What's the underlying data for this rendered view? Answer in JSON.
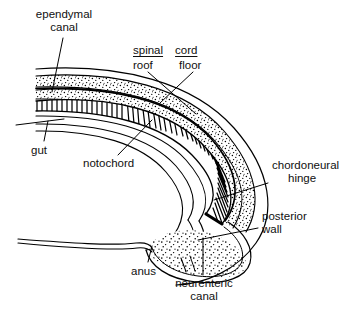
{
  "figure": {
    "type": "line-diagram",
    "background_color": "#ffffff",
    "ink_color": "#000000",
    "labels": {
      "ependymal_canal": {
        "line1": "ependymal",
        "line2": "canal"
      },
      "spinal": "spinal",
      "cord": "cord",
      "roof": "roof",
      "floor": "floor",
      "gut": "gut",
      "notochord": "notochord",
      "chordoneural_hinge": {
        "line1": "chordoneural",
        "line2": "hinge"
      },
      "posterior_wall": {
        "line1": "posterior",
        "line2": "wall"
      },
      "anus": "anus",
      "neurenteric_canal": {
        "line1": "neurenteric",
        "line2": "canal"
      }
    },
    "structures": [
      {
        "name": "ependymal-canal",
        "style": "thin-dark-line",
        "note": "narrow lumen within spinal cord"
      },
      {
        "name": "spinal-cord-roof",
        "style": "stippled-band"
      },
      {
        "name": "spinal-cord-floor",
        "style": "stippled-band"
      },
      {
        "name": "notochord",
        "style": "dense-hatched-band"
      },
      {
        "name": "gut",
        "style": "outline-tube"
      },
      {
        "name": "chordoneural-hinge",
        "style": "inner-pocket"
      },
      {
        "name": "neurenteric-canal",
        "style": "narrow-channel"
      },
      {
        "name": "posterior-wall",
        "style": "stippled-bulb"
      },
      {
        "name": "anus",
        "style": "ventral-opening"
      }
    ]
  }
}
